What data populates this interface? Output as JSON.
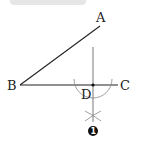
{
  "diagram": {
    "type": "geometry-construction",
    "points": {
      "A": {
        "label": "A",
        "x": 100,
        "y": 26
      },
      "B": {
        "label": "B",
        "x": 20,
        "y": 85
      },
      "C": {
        "label": "C",
        "x": 118,
        "y": 85
      },
      "D": {
        "label": "D",
        "x": 93,
        "y": 85
      }
    },
    "step_marker": {
      "label": "1",
      "shape": "filled-circle"
    },
    "colors": {
      "line": "#222222",
      "construction": "#888888",
      "top_bar": "#e6e6e6"
    }
  }
}
